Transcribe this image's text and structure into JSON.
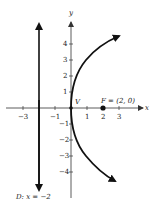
{
  "diagram": {
    "type": "parabola",
    "equation": "y^2 = 8x",
    "axes": {
      "x_label": "x",
      "y_label": "y",
      "x_ticks": [
        {
          "value": -3,
          "label": "−3"
        },
        {
          "value": -1,
          "label": "−1"
        },
        {
          "value": 1,
          "label": "1"
        },
        {
          "value": 2,
          "label": "2"
        },
        {
          "value": 3,
          "label": "3"
        }
      ],
      "y_ticks": [
        {
          "value": 4,
          "label": "4"
        },
        {
          "value": 3,
          "label": "3"
        },
        {
          "value": 2,
          "label": "2"
        },
        {
          "value": 1,
          "label": "1"
        },
        {
          "value": -1,
          "label": "−1"
        },
        {
          "value": -2,
          "label": "−2"
        },
        {
          "value": -3,
          "label": "−3"
        },
        {
          "value": -4,
          "label": "−4"
        }
      ]
    },
    "vertex": {
      "label": "V",
      "x": 0,
      "y": 0
    },
    "focus": {
      "label": "F = (2, 0)",
      "x": 2,
      "y": 0
    },
    "directrix": {
      "label": "D: x = −2",
      "x": -2
    },
    "colors": {
      "ink": "#111111",
      "axis": "#333333",
      "background": "#ffffff"
    }
  }
}
